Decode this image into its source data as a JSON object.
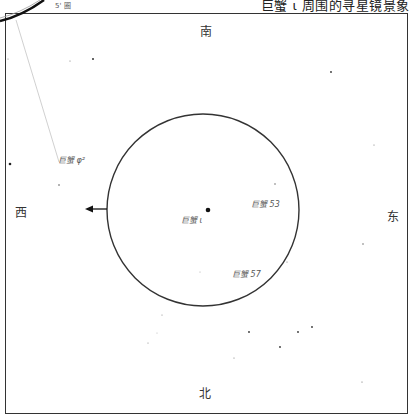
{
  "title": "巨蟹 ι 周围的寻星镜景象",
  "scale_label": "5' 圈",
  "directions": {
    "north": "北",
    "south": "南",
    "east": "东",
    "west": "西"
  },
  "stars": [
    {
      "label": "巨蟹 φ²",
      "x": 58,
      "y": 163
    },
    {
      "label": "巨蟹 ι",
      "x": 208,
      "y": 210
    },
    {
      "label": "巨蟹 53",
      "x": 275,
      "y": 193
    },
    {
      "label": "巨蟹 57",
      "x": 262,
      "y": 267
    }
  ],
  "colors": {
    "line": "#333333",
    "star": "#222222",
    "label": "#555555",
    "guide": "#bbbbbb"
  }
}
